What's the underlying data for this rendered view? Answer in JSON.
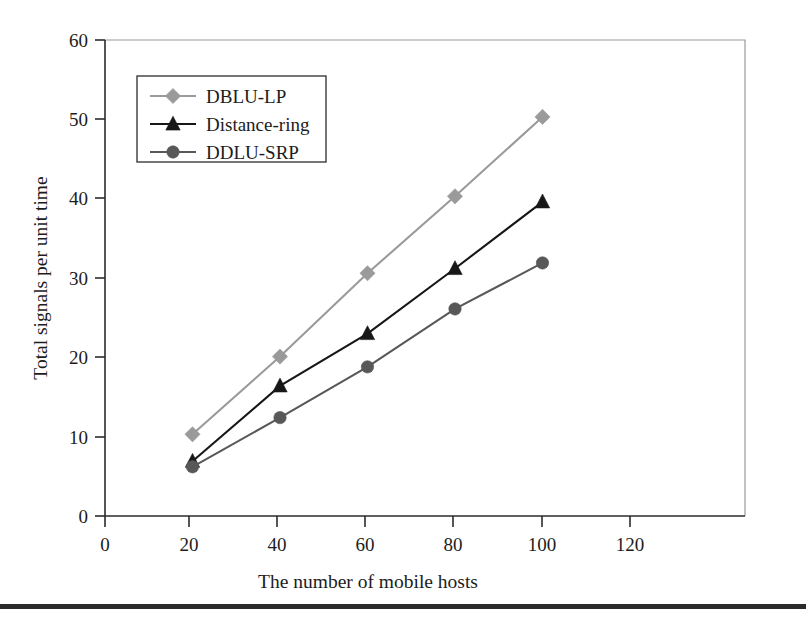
{
  "chart_data": {
    "type": "line",
    "title": "",
    "xlabel": "The number of mobile hosts",
    "ylabel": "Total signals per unit time",
    "x": [
      20,
      40,
      60,
      80,
      100
    ],
    "xlim": [
      0,
      120
    ],
    "ylim": [
      0,
      60
    ],
    "xticks": [
      0,
      20,
      40,
      60,
      80,
      100,
      120
    ],
    "yticks": [
      0,
      10,
      20,
      30,
      40,
      50,
      60
    ],
    "xtick_labels": [
      "0",
      "20",
      "40",
      "60",
      "80",
      "100",
      "120"
    ],
    "ytick_labels": [
      "0",
      "10",
      "20",
      "30",
      "40",
      "50",
      "60"
    ],
    "grid": false,
    "legend_position": "upper-left-inside",
    "series": [
      {
        "name": "DBLU-LP",
        "marker": "diamond",
        "color": "#9a9a9a",
        "values": [
          10.3,
          20.1,
          30.6,
          40.3,
          50.3
        ]
      },
      {
        "name": "Distance-ring",
        "marker": "triangle",
        "color": "#171717",
        "values": [
          6.9,
          16.4,
          23.0,
          31.2,
          39.6
        ]
      },
      {
        "name": "DDLU-SRP",
        "marker": "circle",
        "color": "#585858",
        "values": [
          6.2,
          12.4,
          18.8,
          26.1,
          31.9
        ]
      }
    ]
  },
  "figure": {
    "background_color": "#ffffff",
    "frame_color": "#9a9a9a",
    "axis_color": "#2b2b2b",
    "bottom_rule_color": "#2b2b2b"
  }
}
